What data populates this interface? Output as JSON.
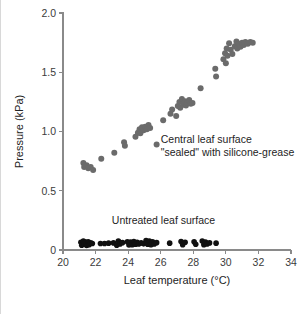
{
  "chart_data": {
    "type": "scatter",
    "title": "",
    "xlabel": "Leaf temperature (°C)",
    "ylabel": "Pressure (kPa)",
    "xlim": [
      20,
      34
    ],
    "ylim": [
      0,
      2.0
    ],
    "xticks": [
      20,
      22,
      24,
      26,
      28,
      30,
      32,
      34
    ],
    "xtick_labels": [
      "20",
      "22",
      "24",
      "26",
      "28",
      "30",
      "32",
      "34"
    ],
    "yticks": [
      0,
      0.5,
      1.0,
      1.5,
      2.0
    ],
    "ytick_labels": [
      "0",
      "0.5",
      "1.0",
      "1.5",
      "2.0"
    ],
    "grid": false,
    "legend_position": "inline-annotation",
    "annotations": [
      {
        "name": "sealed-annotation",
        "lines": [
          "Central leaf surface",
          "\"sealed\" with silicone-grease"
        ],
        "x": 26.0,
        "y": 0.9
      },
      {
        "name": "untreated-annotation",
        "lines": [
          "Untreated leaf surface"
        ],
        "x": 23.0,
        "y": 0.22
      }
    ],
    "series": [
      {
        "name": "Central leaf surface \"sealed\" with silicone-grease",
        "key": "sealed",
        "marker": "circle",
        "color": "#6b6b6b",
        "marker_size": 4.0,
        "points": [
          [
            21.25,
            0.735
          ],
          [
            21.3,
            0.7
          ],
          [
            21.45,
            0.715
          ],
          [
            21.55,
            0.69
          ],
          [
            21.7,
            0.7
          ],
          [
            21.85,
            0.675
          ],
          [
            22.35,
            0.77
          ],
          [
            23.15,
            0.82
          ],
          [
            23.75,
            0.91
          ],
          [
            23.8,
            0.88
          ],
          [
            24.45,
            0.955
          ],
          [
            24.6,
            0.99
          ],
          [
            24.7,
            1.02
          ],
          [
            24.75,
            0.985
          ],
          [
            24.85,
            1.035
          ],
          [
            24.95,
            1.01
          ],
          [
            25.05,
            1.04
          ],
          [
            25.15,
            1.02
          ],
          [
            25.25,
            1.055
          ],
          [
            25.35,
            1.03
          ],
          [
            25.75,
            0.89
          ],
          [
            26.15,
            1.095
          ],
          [
            26.6,
            1.15
          ],
          [
            26.7,
            1.185
          ],
          [
            26.95,
            1.13
          ],
          [
            27.05,
            1.215
          ],
          [
            27.15,
            1.25
          ],
          [
            27.2,
            1.2
          ],
          [
            27.3,
            1.275
          ],
          [
            27.4,
            1.225
          ],
          [
            27.5,
            1.255
          ],
          [
            27.55,
            1.22
          ],
          [
            27.65,
            1.24
          ],
          [
            27.75,
            1.265
          ],
          [
            27.85,
            1.235
          ],
          [
            27.95,
            1.24
          ],
          [
            28.45,
            1.365
          ],
          [
            29.35,
            1.53
          ],
          [
            29.4,
            1.465
          ],
          [
            29.85,
            1.61
          ],
          [
            29.95,
            1.66
          ],
          [
            30.0,
            1.575
          ],
          [
            30.05,
            1.7
          ],
          [
            30.1,
            1.64
          ],
          [
            30.2,
            1.745
          ],
          [
            30.3,
            1.69
          ],
          [
            30.4,
            1.655
          ],
          [
            30.55,
            1.72
          ],
          [
            30.65,
            1.76
          ],
          [
            30.7,
            1.7
          ],
          [
            30.8,
            1.74
          ],
          [
            30.9,
            1.715
          ],
          [
            31.0,
            1.75
          ],
          [
            31.1,
            1.73
          ],
          [
            31.2,
            1.755
          ],
          [
            31.35,
            1.74
          ],
          [
            31.5,
            1.755
          ],
          [
            31.65,
            1.75
          ]
        ]
      },
      {
        "name": "Untreated leaf surface",
        "key": "untreated",
        "marker": "circle",
        "color": "#111111",
        "marker_size": 3.6,
        "points": [
          [
            21.1,
            0.065
          ],
          [
            21.15,
            0.04
          ],
          [
            21.25,
            0.075
          ],
          [
            21.3,
            0.05
          ],
          [
            21.4,
            0.068
          ],
          [
            21.45,
            0.038
          ],
          [
            21.55,
            0.07
          ],
          [
            21.6,
            0.045
          ],
          [
            21.7,
            0.06
          ],
          [
            21.8,
            0.055
          ],
          [
            22.3,
            0.055
          ],
          [
            22.55,
            0.055
          ],
          [
            22.8,
            0.058
          ],
          [
            23.1,
            0.06
          ],
          [
            23.3,
            0.04
          ],
          [
            23.4,
            0.075
          ],
          [
            23.5,
            0.05
          ],
          [
            23.65,
            0.062
          ],
          [
            23.95,
            0.07
          ],
          [
            24.05,
            0.042
          ],
          [
            24.15,
            0.068
          ],
          [
            24.25,
            0.045
          ],
          [
            24.35,
            0.072
          ],
          [
            24.45,
            0.048
          ],
          [
            24.55,
            0.065
          ],
          [
            24.65,
            0.05
          ],
          [
            24.8,
            0.06
          ],
          [
            24.95,
            0.052
          ],
          [
            25.1,
            0.08
          ],
          [
            25.2,
            0.048
          ],
          [
            25.3,
            0.075
          ],
          [
            25.4,
            0.045
          ],
          [
            25.5,
            0.07
          ],
          [
            25.6,
            0.05
          ],
          [
            25.75,
            0.062
          ],
          [
            26.55,
            0.058
          ],
          [
            27.25,
            0.072
          ],
          [
            27.35,
            0.045
          ],
          [
            27.5,
            0.065
          ],
          [
            28.05,
            0.07
          ],
          [
            28.15,
            0.048
          ],
          [
            28.55,
            0.075
          ],
          [
            28.65,
            0.045
          ],
          [
            28.75,
            0.068
          ],
          [
            28.85,
            0.05
          ],
          [
            29.0,
            0.06
          ],
          [
            29.4,
            0.058
          ]
        ]
      }
    ]
  }
}
